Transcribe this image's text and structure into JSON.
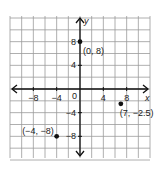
{
  "chart_data": {
    "type": "scatter",
    "title": "",
    "xlabel": "x",
    "ylabel": "y",
    "xlim": [
      -12,
      12
    ],
    "ylim": [
      -12,
      12
    ],
    "grid": true,
    "grid_step": 2,
    "x_ticks": [
      {
        "value": -8,
        "label": "−8"
      },
      {
        "value": -4,
        "label": "−4"
      },
      {
        "value": 4,
        "label": "4"
      },
      {
        "value": 8,
        "label": "8"
      }
    ],
    "y_ticks": [
      {
        "value": 8,
        "label": "8"
      },
      {
        "value": 4,
        "label": "4"
      },
      {
        "value": -4,
        "label": "−4"
      },
      {
        "value": -8,
        "label": "−8"
      }
    ],
    "origin_label": "0",
    "points": [
      {
        "x": 0,
        "y": 8,
        "label": "(0, 8)"
      },
      {
        "x": 7,
        "y": -2.5,
        "label": "(7, −2.5)"
      },
      {
        "x": -4,
        "y": -8,
        "label": "(−4, −8)"
      }
    ]
  }
}
